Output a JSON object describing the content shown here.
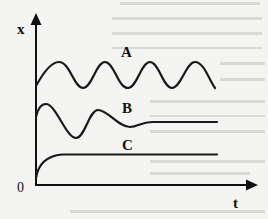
{
  "diagram": {
    "axes": {
      "y_label": "x",
      "x_label": "t",
      "origin_label": "0"
    },
    "curves": [
      {
        "id": "A",
        "label": "A",
        "description": "sustained (undamped) oscillation"
      },
      {
        "id": "B",
        "label": "B",
        "description": "damped oscillation settling to steady value"
      },
      {
        "id": "C",
        "label": "C",
        "description": "monotonic (overdamped) rise to steady value"
      }
    ],
    "colors": {
      "background": "#f4f4f2",
      "ink": "#1a1a1a"
    }
  }
}
